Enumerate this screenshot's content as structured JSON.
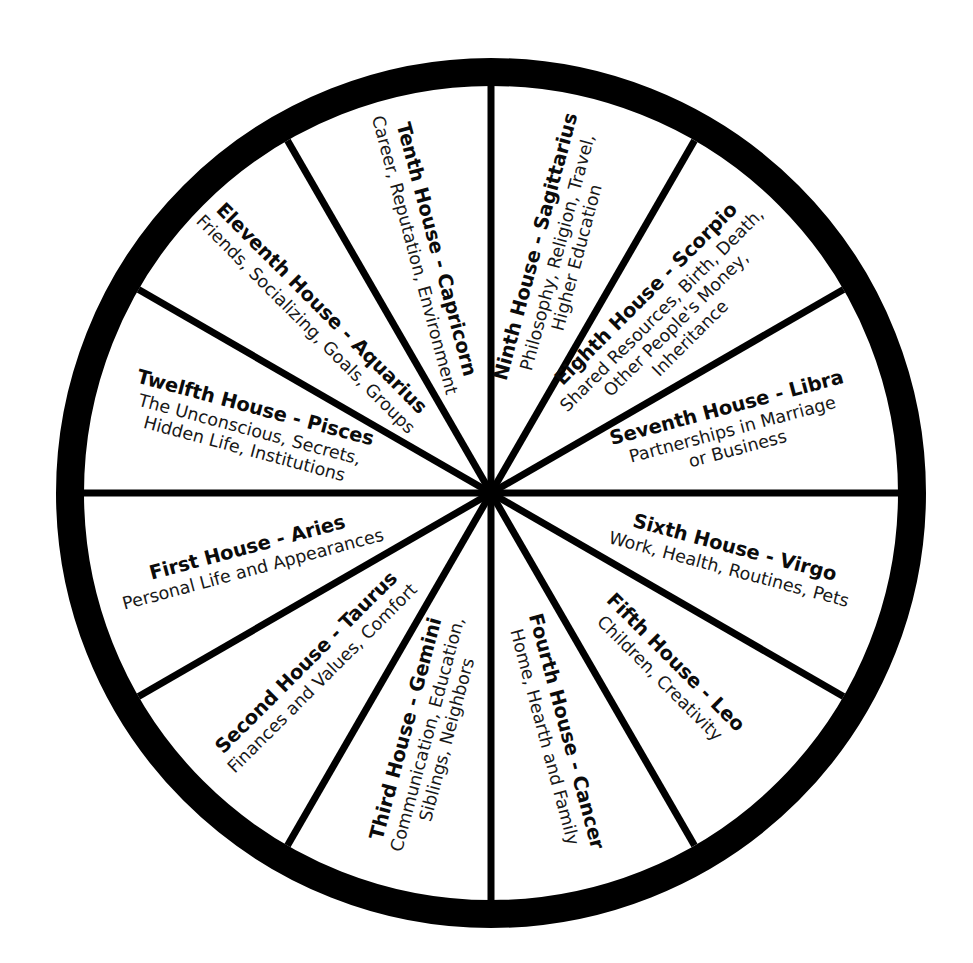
{
  "diagram": {
    "kind": "astrological-houses-wheel",
    "segment_count": 12,
    "colors": {
      "ink": "#000000",
      "background": "#ffffff",
      "ring": "#000000",
      "spoke": "#000000"
    },
    "geometry": {
      "center_x": 491,
      "center_y": 493,
      "outer_radius": 435,
      "ring_thickness": 28,
      "spoke_width": 7,
      "sector_degrees": 30
    }
  },
  "houses": [
    {
      "index": 1,
      "title": "First House - Aries",
      "desc_lines": [
        "Personal Life and Appearances"
      ],
      "sign": "Aries",
      "label_rotation": -15,
      "anchor_angle": 165,
      "anchor_radius": 250
    },
    {
      "index": 2,
      "title": "Second House - Taurus",
      "desc_lines": [
        "Finances and Values, Comfort"
      ],
      "sign": "Taurus",
      "label_rotation": -45,
      "anchor_angle": 135,
      "anchor_radius": 250
    },
    {
      "index": 3,
      "title": "Third House - Gemini",
      "desc_lines": [
        "Communication, Education,",
        "Siblings, Neighbors"
      ],
      "sign": "Gemini",
      "label_rotation": -75,
      "anchor_angle": 105,
      "anchor_radius": 250
    },
    {
      "index": 4,
      "title": "Fourth House - Cancer",
      "desc_lines": [
        "Home, Hearth and Family"
      ],
      "sign": "Cancer",
      "label_rotation": 75,
      "anchor_angle": 75,
      "anchor_radius": 250
    },
    {
      "index": 5,
      "title": "Fifth House - Leo",
      "desc_lines": [
        "Children, Creativity"
      ],
      "sign": "Leo",
      "label_rotation": 45,
      "anchor_angle": 45,
      "anchor_radius": 250
    },
    {
      "index": 6,
      "title": "Sixth House - Virgo",
      "desc_lines": [
        "Work, Health, Routines, Pets"
      ],
      "sign": "Virgo",
      "label_rotation": 15,
      "anchor_angle": 15,
      "anchor_radius": 250
    },
    {
      "index": 7,
      "title": "Seventh House - Libra",
      "desc_lines": [
        "Partnerships in Marriage",
        "or Business"
      ],
      "sign": "Libra",
      "label_rotation": -15,
      "anchor_angle": -15,
      "anchor_radius": 250
    },
    {
      "index": 8,
      "title": "Eighth House - Scorpio",
      "desc_lines": [
        "Shared Resources, Birth, Death,",
        "Other People's Money,",
        "Inheritance"
      ],
      "sign": "Scorpio",
      "label_rotation": -45,
      "anchor_angle": -45,
      "anchor_radius": 250
    },
    {
      "index": 9,
      "title": "Ninth House - Sagittarius",
      "desc_lines": [
        "Philosophy, Religion, Travel,",
        "Higher Education"
      ],
      "sign": "Sagittarius",
      "label_rotation": -75,
      "anchor_angle": -75,
      "anchor_radius": 250
    },
    {
      "index": 10,
      "title": "Tenth House - Capricorn",
      "desc_lines": [
        "Career, Reputation, Environment"
      ],
      "sign": "Capricorn",
      "label_rotation": 75,
      "anchor_angle": -105,
      "anchor_radius": 250
    },
    {
      "index": 11,
      "title": "Eleventh House - Aquarius",
      "desc_lines": [
        "Friends, Socializing, Goals, Groups"
      ],
      "sign": "Aquarius",
      "label_rotation": 45,
      "anchor_angle": -135,
      "anchor_radius": 250
    },
    {
      "index": 12,
      "title": "Twelfth House - Pisces",
      "desc_lines": [
        "The Unconscious, Secrets,",
        "Hidden Life, Institutions"
      ],
      "sign": "Pisces",
      "label_rotation": 15,
      "anchor_angle": -165,
      "anchor_radius": 250
    }
  ]
}
